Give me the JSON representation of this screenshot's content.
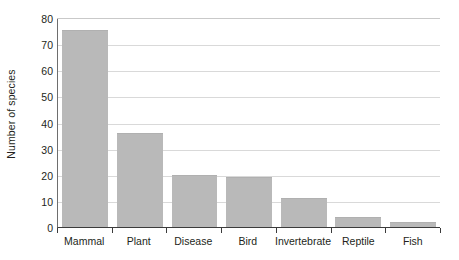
{
  "chart_data": {
    "type": "bar",
    "title": "",
    "xlabel": "",
    "ylabel": "Number of species",
    "categories": [
      "Mammal",
      "Plant",
      "Disease",
      "Bird",
      "Invertebrate",
      "Reptile",
      "Fish"
    ],
    "values": [
      75.5,
      36,
      20,
      19,
      11,
      4,
      2
    ],
    "ylim": [
      0,
      80
    ],
    "ytick_step": 10,
    "ytick_labels": [
      "80",
      "70",
      "60",
      "50",
      "40",
      "30",
      "20",
      "10",
      "0"
    ],
    "ytick_values": [
      80,
      70,
      60,
      50,
      40,
      30,
      20,
      10,
      0
    ],
    "grid": true,
    "grid_axis": "y",
    "legend": false,
    "legend_position": "none",
    "bar_color": "#b9b9b9",
    "grid_color": "#d9d9d9",
    "axis_color": "#3b3b3b",
    "text_color": "#231f20",
    "background_color": "#ffffff"
  }
}
